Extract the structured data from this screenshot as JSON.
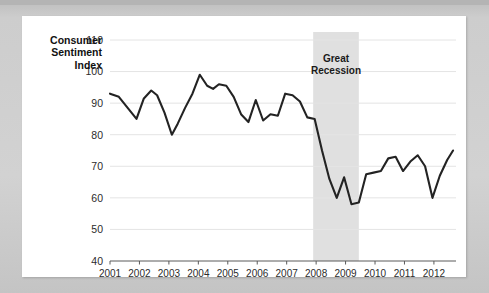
{
  "card": {
    "background_color": "#ffffff",
    "frame_color": "#cfcfcf"
  },
  "chart_data": {
    "type": "line",
    "title": "",
    "xlabel": "",
    "ylabel": "Consumer Sentiment Index",
    "ylabel_lines": [
      "Consumer",
      "Sentiment",
      "Index"
    ],
    "xlim": [
      2001,
      2012.75
    ],
    "ylim": [
      40,
      110
    ],
    "yticks": [
      40,
      50,
      60,
      70,
      80,
      90,
      100,
      110
    ],
    "ytick_labels": [
      "40",
      "50",
      "60",
      "70",
      "80",
      "90",
      "100",
      "110"
    ],
    "xticks": [
      2001,
      2002,
      2003,
      2004,
      2005,
      2006,
      2007,
      2008,
      2009,
      2010,
      2011,
      2012
    ],
    "xtick_labels": [
      "2001",
      "2002",
      "2003",
      "2004",
      "2005",
      "2006",
      "2007",
      "2008",
      "2009",
      "2010",
      "2011",
      "2012"
    ],
    "grid": true,
    "grid_axis": "y",
    "legend": false,
    "line_color": "#232323",
    "series": [
      {
        "name": "Consumer Sentiment Index",
        "x": [
          2001.0,
          2001.3,
          2001.6,
          2001.9,
          2002.15,
          2002.4,
          2002.6,
          2002.85,
          2003.1,
          2003.3,
          2003.55,
          2003.8,
          2004.05,
          2004.3,
          2004.5,
          2004.7,
          2004.95,
          2005.2,
          2005.45,
          2005.7,
          2005.95,
          2006.2,
          2006.45,
          2006.7,
          2006.95,
          2007.2,
          2007.45,
          2007.7,
          2007.95,
          2008.2,
          2008.45,
          2008.7,
          2008.95,
          2009.2,
          2009.45,
          2009.7,
          2009.95,
          2010.2,
          2010.45,
          2010.7,
          2010.95,
          2011.2,
          2011.45,
          2011.7,
          2011.95,
          2012.2,
          2012.45,
          2012.65
        ],
        "values": [
          93.0,
          92.0,
          88.5,
          85.0,
          91.5,
          94.0,
          92.5,
          87.0,
          80.0,
          83.5,
          88.5,
          93.0,
          99.0,
          95.5,
          94.5,
          96.0,
          95.5,
          92.0,
          86.5,
          84.0,
          91.0,
          84.5,
          86.5,
          86.0,
          93.0,
          92.5,
          90.5,
          85.5,
          85.0,
          75.0,
          66.0,
          60.0,
          66.5,
          58.0,
          58.5,
          67.5,
          68.0,
          68.5,
          72.5,
          73.0,
          68.5,
          71.5,
          73.5,
          70.0,
          60.0,
          67.0,
          72.0,
          75.0
        ]
      }
    ],
    "annotations": [
      {
        "name": "recession-band",
        "label": "Great Recession",
        "label_lines": [
          "Great",
          "Recession"
        ],
        "x_start": 2007.9,
        "x_end": 2009.45,
        "fill": "#e0e0e0"
      }
    ]
  }
}
